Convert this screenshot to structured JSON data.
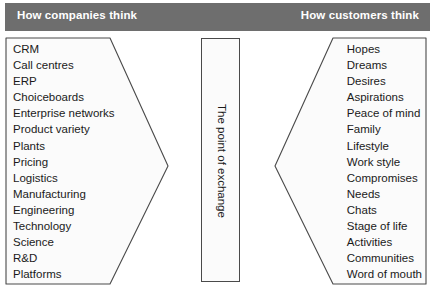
{
  "figure": {
    "title_left": "How companies think",
    "title_right": "How customers think",
    "centre_label": "The point of exchange"
  },
  "colors": {
    "header_band": "#6e6e6e",
    "header_text": "#ffffff",
    "shape_fill": "#fbfbfb",
    "shape_stroke": "#4a4a4a",
    "body_text": "#1a1a1a",
    "page_background": "#ffffff"
  },
  "left_panel": {
    "heading": "How companies think",
    "items": [
      "CRM",
      "Call centres",
      "ERP",
      "Choiceboards",
      "Enterprise networks",
      "Product variety",
      "Plants",
      "Pricing",
      "Logistics",
      "Manufacturing",
      "Engineering",
      "Technology",
      "Science",
      "R&D",
      "Platforms"
    ]
  },
  "centre_panel": {
    "label": "The point of exchange"
  },
  "right_panel": {
    "heading": "How customers think",
    "items": [
      "Hopes",
      "Dreams",
      "Desires",
      "Aspirations",
      "Peace of mind",
      "Family",
      "Lifestyle",
      "Work style",
      "Compromises",
      "Needs",
      "Chats",
      "Stage of life",
      "Activities",
      "Communities",
      "Word of mouth"
    ]
  }
}
